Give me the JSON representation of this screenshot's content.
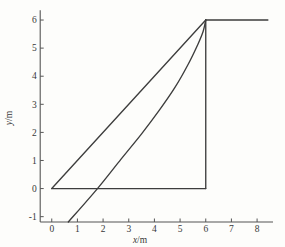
{
  "figure": {
    "background_color": "#fdfdfb"
  },
  "chart_data": {
    "type": "line",
    "title": "",
    "xlabel": "x/m",
    "ylabel": "y/m",
    "x_ticks": [
      0,
      1,
      2,
      3,
      4,
      5,
      6,
      7,
      8
    ],
    "y_ticks": [
      -1,
      0,
      1,
      2,
      3,
      4,
      5,
      6
    ],
    "xlim": [
      -0.45,
      8.62
    ],
    "ylim": [
      -1.19,
      6.35
    ],
    "grid": false,
    "legend": false,
    "colors": {
      "line": "#3d3d3d",
      "axis": "#555555",
      "text": "#383838"
    },
    "series": [
      {
        "name": "diagonal-line",
        "style": "straight",
        "points": [
          [
            0,
            0
          ],
          [
            6,
            6
          ]
        ]
      },
      {
        "name": "baseline-y0",
        "style": "straight",
        "points": [
          [
            0,
            0
          ],
          [
            6,
            0
          ]
        ]
      },
      {
        "name": "vertical-line-x6",
        "style": "straight",
        "points": [
          [
            6,
            0
          ],
          [
            6,
            6
          ]
        ]
      },
      {
        "name": "top-horizontal-y6",
        "style": "straight",
        "points": [
          [
            6,
            6
          ],
          [
            8.42,
            6
          ]
        ]
      },
      {
        "name": "curved-trajectory",
        "style": "smooth",
        "points": [
          [
            0.645,
            -1.19
          ],
          [
            1.78,
            0
          ],
          [
            2.7,
            1.05
          ],
          [
            3.5,
            1.95
          ],
          [
            4.2,
            2.8
          ],
          [
            4.8,
            3.6
          ],
          [
            5.3,
            4.4
          ],
          [
            5.7,
            5.15
          ],
          [
            5.9,
            5.6
          ],
          [
            6,
            6
          ]
        ]
      }
    ]
  }
}
